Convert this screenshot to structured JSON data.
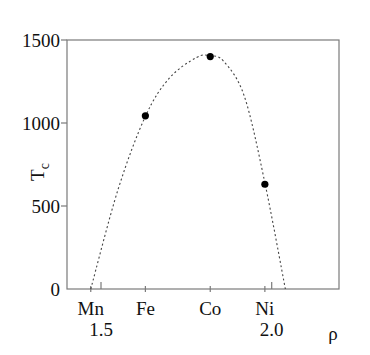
{
  "chart_data": {
    "type": "scatter",
    "title": "",
    "xlabel": "ρ",
    "ylabel": "T",
    "ylabel_subscript": "c",
    "ylim": [
      0,
      1500
    ],
    "xlim": [
      1.4,
      2.2
    ],
    "yticks": [
      0,
      500,
      1000,
      1500
    ],
    "ytick_labels": [
      "0",
      "500",
      "1000",
      "1500"
    ],
    "xticks_numeric": [
      1.5,
      2.0
    ],
    "xtick_numeric_labels": [
      "1.5",
      "2.0"
    ],
    "element_ticks": [
      {
        "label": "Mn",
        "x": 1.47
      },
      {
        "label": "Fe",
        "x": 1.63
      },
      {
        "label": "Co",
        "x": 1.82
      },
      {
        "label": "Ni",
        "x": 1.98
      }
    ],
    "series": [
      {
        "name": "measured Tc",
        "style": "filled-circle",
        "points": [
          {
            "label": "Fe",
            "x": 1.63,
            "y": 1043
          },
          {
            "label": "Co",
            "x": 1.82,
            "y": 1400
          },
          {
            "label": "Ni",
            "x": 1.98,
            "y": 631
          }
        ]
      },
      {
        "name": "parabolic fit",
        "style": "dotted-line",
        "x": [
          1.47,
          1.55,
          1.63,
          1.7,
          1.78,
          1.82,
          1.86,
          1.92,
          1.98,
          2.04
        ],
        "y": [
          0,
          600,
          1040,
          1270,
          1395,
          1405,
          1370,
          1160,
          640,
          0
        ]
      }
    ],
    "grid": false,
    "legend": null
  }
}
